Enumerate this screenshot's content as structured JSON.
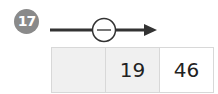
{
  "problem": {
    "number": "17",
    "operator": "−",
    "cells": [
      "",
      "19",
      "46"
    ],
    "colors": {
      "badge": "#8a8a8a",
      "shaded": "#f0f0f0",
      "line": "#333333"
    }
  }
}
